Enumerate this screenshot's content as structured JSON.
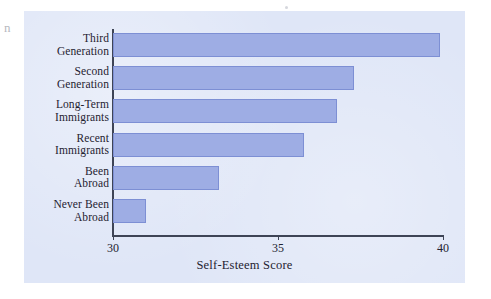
{
  "page": {
    "margin_artifact": "n"
  },
  "chart_data": {
    "type": "bar",
    "orientation": "horizontal",
    "title": "",
    "xlabel": "Self-Esteem Score",
    "ylabel": "",
    "xlim": [
      30,
      40
    ],
    "xticks": [
      30,
      35,
      40
    ],
    "xtick_labels": [
      "30",
      "35",
      "40"
    ],
    "grid": false,
    "legend": false,
    "categories": [
      "Third Generation",
      "Second Generation",
      "Long-Term Immigrants",
      "Recent Immigrants",
      "Been Abroad",
      "Never Been Abroad"
    ],
    "category_lines": [
      [
        "Third",
        "Generation"
      ],
      [
        "Second",
        "Generation"
      ],
      [
        "Long-Term",
        "Immigrants"
      ],
      [
        "Recent",
        "Immigrants"
      ],
      [
        "Been",
        "Abroad"
      ],
      [
        "Never Been",
        "Abroad"
      ]
    ],
    "values": [
      39.9,
      37.3,
      36.8,
      35.8,
      33.2,
      31.0
    ],
    "bar_color": "#9eade4",
    "bar_edge_color": "#7d8fd4",
    "panel_background": "#dfe6f7",
    "axis_color": "#3e4456",
    "text_color": "#1f2230"
  }
}
